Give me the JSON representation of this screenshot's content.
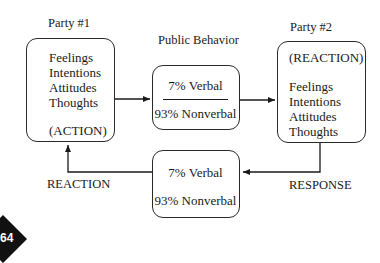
{
  "diagram": {
    "party1": {
      "title": "Party #1",
      "lines": [
        "Feelings",
        "Intentions",
        "Attitudes",
        "Thoughts"
      ],
      "tag": "(ACTION)"
    },
    "public_behavior": {
      "title": "Public Behavior",
      "verbal": "7% Verbal",
      "nonverbal": "93% Nonverbal"
    },
    "party2": {
      "title": "Party #2",
      "tag": "(REACTION)",
      "lines": [
        "Feelings",
        "Intentions",
        "Attitudes",
        "Thoughts"
      ]
    },
    "return_behavior": {
      "verbal": "7% Verbal",
      "nonverbal": "93% Nonverbal"
    },
    "edge_labels": {
      "reaction": "REACTION",
      "response": "RESPONSE"
    },
    "page_badge": "64"
  }
}
